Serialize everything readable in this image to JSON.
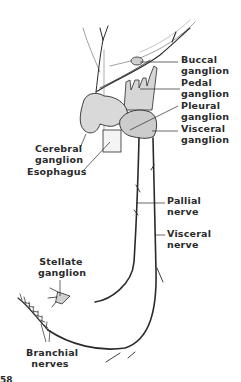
{
  "diagram": {
    "labels": {
      "buccal_ganglion": [
        "Buccal",
        "ganglion"
      ],
      "pedal_ganglion": [
        "Pedal",
        "ganglion"
      ],
      "pleural_ganglion": [
        "Pleural",
        "ganglion"
      ],
      "visceral_ganglion": [
        "Visceral",
        "ganglion"
      ],
      "cerebral_ganglion": [
        "Cerebral",
        "ganglion"
      ],
      "esophagus": [
        "Esophagus"
      ],
      "pallial_nerve": [
        "Pallial",
        "nerve"
      ],
      "visceral_nerve": [
        "Visceral",
        "nerve"
      ],
      "stellate_ganglion": [
        "Stellate",
        "ganglion"
      ],
      "branchial_nerves": [
        "Branchial",
        "nerves"
      ]
    },
    "figure_number_partial": "58",
    "colors": {
      "ink": "#2a2a2a",
      "shading": "#bdbdbd",
      "background": "#ffffff"
    }
  }
}
